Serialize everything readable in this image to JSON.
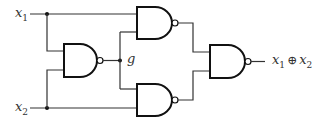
{
  "diagram": {
    "type": "logic-circuit",
    "inputs": [
      {
        "name": "x",
        "sub": "1"
      },
      {
        "name": "x",
        "sub": "2"
      }
    ],
    "intermediate_label": "g",
    "output": {
      "a_name": "x",
      "a_sub": "1",
      "operator": "⊕",
      "b_name": "x",
      "b_sub": "2"
    },
    "gates": [
      {
        "id": "nand-g",
        "type": "NAND",
        "inputs": [
          "x1",
          "x2"
        ],
        "output": "g"
      },
      {
        "id": "nand-top",
        "type": "NAND",
        "inputs": [
          "x1",
          "g"
        ]
      },
      {
        "id": "nand-bottom",
        "type": "NAND",
        "inputs": [
          "g",
          "x2"
        ]
      },
      {
        "id": "nand-out",
        "type": "NAND",
        "inputs": [
          "nand-top",
          "nand-bottom"
        ],
        "output": "x1 ⊕ x2"
      }
    ],
    "colors": {
      "line": "#333333",
      "gate": "#111111",
      "background": "#ffffff"
    }
  }
}
